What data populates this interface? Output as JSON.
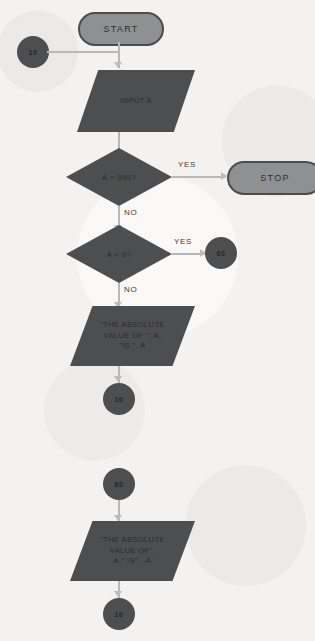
{
  "diagram": {
    "background_color": "#f3f2f0",
    "shape_fill_color": "#4d4e50",
    "terminator_fill_color": "#8f9092",
    "connector_line_color": "#b9b8b6"
  },
  "nodes": {
    "start": {
      "label": "START",
      "type": "terminator"
    },
    "connector_10_top": {
      "label": "10",
      "type": "connector"
    },
    "input_a": {
      "label": "INPUT A",
      "type": "input-output"
    },
    "decision_equals_999": {
      "label": "A = 999?",
      "type": "decision"
    },
    "stop": {
      "label": "STOP",
      "type": "terminator"
    },
    "decision_less_than_zero": {
      "label": "A < 0?",
      "type": "decision"
    },
    "connector_60_right": {
      "label": "60",
      "type": "connector"
    },
    "print_positive": {
      "label": "\"THE ABSOLUTE\nVALUE OF \", A,\n\"IS \", A",
      "type": "input-output"
    },
    "connector_10_mid": {
      "label": "10",
      "type": "connector"
    },
    "connector_60_bottom": {
      "label": "60",
      "type": "connector"
    },
    "print_negative": {
      "label": "\"THE ABSOLUTE\nVALUE OF\",\nA,\" IS\", -A",
      "type": "input-output"
    },
    "connector_10_bottom": {
      "label": "10",
      "type": "connector"
    }
  },
  "edge_labels": {
    "yes_999": "YES",
    "no_999": "NO",
    "yes_negative": "YES",
    "no_negative": "NO"
  }
}
